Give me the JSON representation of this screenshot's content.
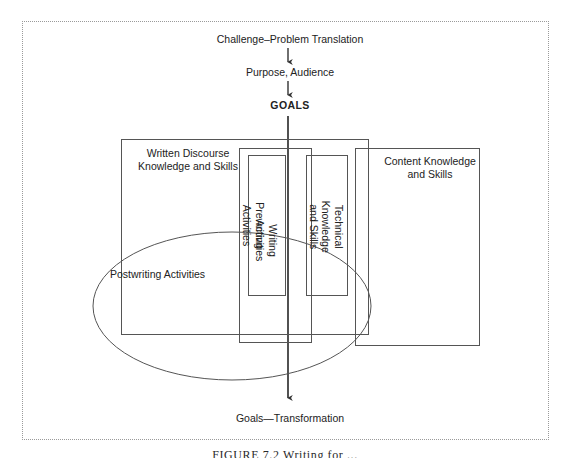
{
  "figure": {
    "background_color": "#ffffff",
    "line_color": "#4a4a4a",
    "text_color": "#222222",
    "frame_style": "dotted"
  },
  "flow": {
    "top_label": "Challenge–Problem Translation",
    "second_label": "Purpose, Audience",
    "goals_label": "GOALS",
    "bottom_label": "Goals—Transformation"
  },
  "boxes": {
    "written_discourse": "Written Discourse\nKnowledge and Skills",
    "content_knowledge": "Content Knowledge\nand Skills",
    "prewriting": "Prewriting Activities",
    "writing": "Writing Activities",
    "technical": "Technical Knowledge\nand Skills"
  },
  "ellipse": {
    "label": "Postwriting Activities"
  },
  "caption": {
    "text": "FIGURE 7.2   Writing for ..."
  }
}
